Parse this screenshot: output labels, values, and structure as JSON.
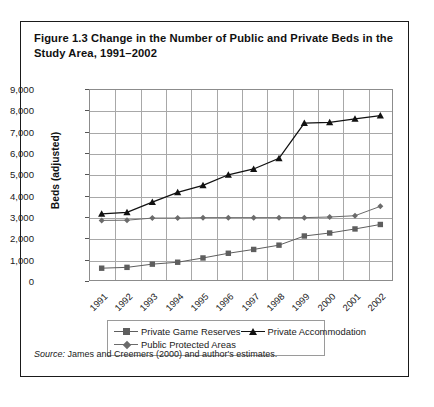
{
  "figure": {
    "title": "Figure 1.3  Change in the Number of Public and Private Beds in the Study Area, 1991–2002",
    "source_prefix": "Source:",
    "source_text": " James and Creemers (2000) and author's estimates."
  },
  "chart_data": {
    "type": "line",
    "title": "Change in the Number of Public and Private Beds in the Study Area, 1991–2002",
    "xlabel": "",
    "ylabel": "Beds (adjusted)",
    "categories": [
      "1991",
      "1992",
      "1993",
      "1994",
      "1995",
      "1996",
      "1997",
      "1998",
      "1999",
      "2000",
      "2001",
      "2002"
    ],
    "ylim": [
      0,
      9000
    ],
    "ytick_labels": [
      "0",
      "1,000",
      "2,000",
      "3,000",
      "4,000",
      "5,000",
      "6,000",
      "7,000",
      "8,000",
      "9,000"
    ],
    "ytick_values": [
      0,
      1000,
      2000,
      3000,
      4000,
      5000,
      6000,
      7000,
      8000,
      9000
    ],
    "grid": true,
    "legend_position": "bottom",
    "series": [
      {
        "name": "Private Game Reserves",
        "marker": "square",
        "color": "#5e5e5e",
        "values": [
          600,
          640,
          790,
          880,
          1080,
          1300,
          1480,
          1680,
          2110,
          2250,
          2440,
          2650
        ]
      },
      {
        "name": "Private Accommodation",
        "marker": "triangle",
        "color": "#111111",
        "values": [
          3150,
          3220,
          3700,
          4150,
          4480,
          4980,
          5250,
          5750,
          7400,
          7440,
          7600,
          7750
        ]
      },
      {
        "name": "Public Protected Areas",
        "marker": "diamond",
        "color": "#6b6b6b",
        "values": [
          2840,
          2850,
          2950,
          2950,
          2970,
          2970,
          2970,
          2970,
          2970,
          3000,
          3060,
          3500
        ]
      }
    ]
  }
}
